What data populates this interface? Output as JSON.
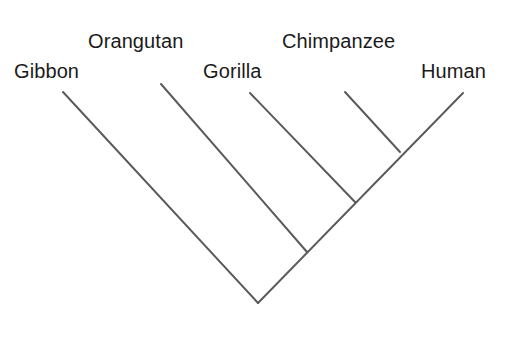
{
  "diagram": {
    "kind": "cladogram",
    "title_visible": false,
    "background_color": "#ffffff",
    "line_color": "#5b5b5b",
    "line_width": 2,
    "label_color": "#1b1b1b",
    "label_font_size": 20,
    "root": {
      "x": 258,
      "y": 303
    },
    "taxa": [
      {
        "name": "gibbon",
        "label": "Gibbon",
        "label_x": 14,
        "label_y": 61,
        "tip": {
          "x": 63,
          "y": 92
        },
        "join": {
          "x": 258,
          "y": 303
        }
      },
      {
        "name": "orangutan",
        "label": "Orangutan",
        "label_x": 88,
        "label_y": 31,
        "tip": {
          "x": 161,
          "y": 84
        },
        "join": {
          "x": 307,
          "y": 252
        }
      },
      {
        "name": "gorilla",
        "label": "Gorilla",
        "label_x": 203,
        "label_y": 61,
        "tip": {
          "x": 250,
          "y": 93
        },
        "join": {
          "x": 355,
          "y": 202
        }
      },
      {
        "name": "chimpanzee",
        "label": "Chimpanzee",
        "label_x": 282,
        "label_y": 31,
        "tip": {
          "x": 345,
          "y": 92
        },
        "join": {
          "x": 400,
          "y": 152
        }
      },
      {
        "name": "human",
        "label": "Human",
        "label_x": 421,
        "label_y": 61,
        "tip": {
          "x": 463,
          "y": 93
        },
        "join": {
          "x": 258,
          "y": 303
        }
      }
    ],
    "backbone": {
      "name": "main-lineage",
      "from": {
        "x": 258,
        "y": 303
      },
      "to": {
        "x": 463,
        "y": 93
      }
    }
  }
}
